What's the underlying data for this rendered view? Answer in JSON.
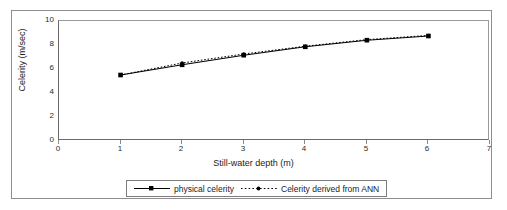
{
  "chart_data": {
    "type": "line",
    "title": "",
    "xlabel": "Still-water depth (m)",
    "ylabel": "Celerity (m/sec)",
    "xlim": [
      0,
      7
    ],
    "ylim": [
      0,
      10
    ],
    "xticks": [
      0,
      1,
      2,
      3,
      4,
      5,
      6,
      7
    ],
    "yticks": [
      0,
      2,
      4,
      6,
      8,
      10
    ],
    "grid": false,
    "legend_position": "bottom-center",
    "x": [
      1,
      2,
      3,
      4,
      5,
      6
    ],
    "series": [
      {
        "name": "physical celerity",
        "values": [
          5.5,
          6.35,
          7.15,
          7.85,
          8.4,
          8.75
        ],
        "style": "solid",
        "marker": "square",
        "color": "#000000"
      },
      {
        "name": "Celerity derived from ANN",
        "values": [
          5.5,
          6.5,
          7.25,
          7.9,
          8.45,
          8.8
        ],
        "style": "dotted",
        "marker": "dot",
        "color": "#000000"
      }
    ]
  },
  "axes": {
    "y_title": "Celerity (m/sec)",
    "x_title": "Still-water depth (m)",
    "y_tick_labels": [
      "10",
      "8",
      "6",
      "4",
      "2",
      "0"
    ],
    "x_tick_labels": [
      "0",
      "1",
      "2",
      "3",
      "4",
      "5",
      "6",
      "7"
    ]
  },
  "legend": {
    "entries": [
      {
        "label": "physical celerity"
      },
      {
        "label": "Celerity derived from ANN"
      }
    ]
  },
  "colors": {
    "line": "#000000",
    "frame": "#6a6a6a",
    "outer_frame": "#8d8d8d",
    "text": "#1c1c1c",
    "background": "#ffffff"
  }
}
